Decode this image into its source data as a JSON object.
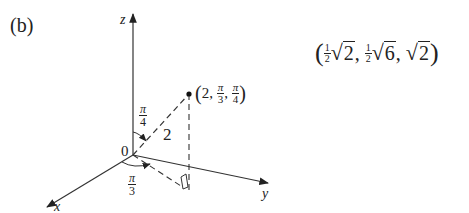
{
  "panel_label": "(b)",
  "axes": {
    "x_label": "x",
    "y_label": "y",
    "z_label": "z",
    "origin_label": "0"
  },
  "point": {
    "label_open": "(",
    "rho": "2",
    "theta_num": "π",
    "theta_den": "3",
    "phi_num": "π",
    "phi_den": "4",
    "label_close": ")",
    "sep": ","
  },
  "segment_length_label": "2",
  "angles": {
    "phi": {
      "num": "π",
      "den": "4"
    },
    "theta": {
      "num": "π",
      "den": "3"
    }
  },
  "rectangular_result": {
    "open": "(",
    "c1_num": "1",
    "c1_den": "2",
    "c1_rad": "2",
    "c2_num": "1",
    "c2_den": "2",
    "c2_rad": "6",
    "c3_rad": "2",
    "sep": ",",
    "close": ")"
  },
  "colors": {
    "ink": "#222222",
    "background": "#ffffff"
  }
}
